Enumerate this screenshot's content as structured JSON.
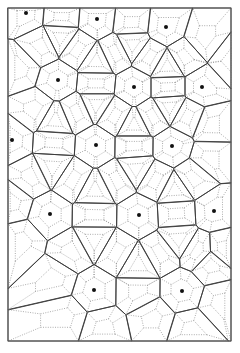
{
  "diagram": {
    "type": "voronoi-tessellation",
    "frame": {
      "x": 8,
      "y": 8,
      "width": 223,
      "height": 333
    },
    "colors": {
      "solid": "#3a3a3a",
      "dotted": "#8a8a8a",
      "dot": "#111111",
      "background": "#ffffff"
    },
    "primary_sites": [
      [
        26,
        13
      ],
      [
        97,
        19
      ],
      [
        166,
        27
      ],
      [
        58,
        80
      ],
      [
        134,
        87
      ],
      [
        202,
        87
      ],
      [
        12,
        140
      ],
      [
        96,
        145
      ],
      [
        172,
        146
      ],
      [
        50,
        214
      ],
      [
        139,
        215
      ],
      [
        214,
        211
      ],
      [
        94,
        290
      ],
      [
        182,
        291
      ]
    ],
    "inner_ratio": 0.5
  }
}
